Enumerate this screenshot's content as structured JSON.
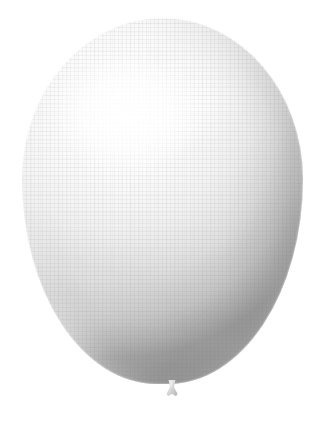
{
  "image": {
    "subject": "balloon",
    "description": "White pearlized latex balloon, inflated, photographed on a plain white background",
    "background_color": "#ffffff",
    "canvas": {
      "width": 325,
      "height": 424
    }
  },
  "balloon": {
    "name": "balloon",
    "color_name": "white",
    "body_color": "#dcdcdc",
    "highlight_color": "#ffffff",
    "shadow_color": "#9a9a9a",
    "midtone_color": "#c3c3c3",
    "silhouette": {
      "left": 22,
      "top": 18,
      "width": 281,
      "height": 366,
      "apex_x": 165,
      "apex_y": 18,
      "widest_y": 198,
      "bottom_y": 383
    },
    "highlight": {
      "name": "specular-highlight",
      "center_x": 128,
      "center_y": 112,
      "radius_x": 78,
      "radius_y": 62
    },
    "knot": {
      "name": "balloon-knot",
      "color": "#d2d2d2",
      "left": 161,
      "top": 380,
      "width": 22,
      "height": 18
    },
    "texture": {
      "name": "surface-weave-texture",
      "pattern": "fine orthogonal grid",
      "cell_size_px": 4,
      "tint": "#787878"
    }
  }
}
